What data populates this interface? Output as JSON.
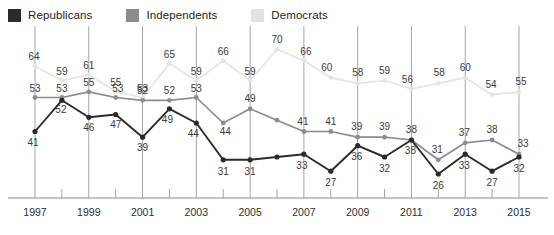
{
  "legend": {
    "position": "top-left",
    "items": [
      {
        "label": "Republicans",
        "color": "#2b2b2b",
        "icon": "legend-swatch"
      },
      {
        "label": "Independents",
        "color": "#8c8c8c",
        "icon": "legend-swatch"
      },
      {
        "label": "Democrats",
        "color": "#e2e2e2",
        "icon": "legend-swatch"
      }
    ]
  },
  "chart_data": {
    "type": "line",
    "title": "",
    "subtitle": "",
    "xlabel": "",
    "ylabel": "",
    "x": [
      1997,
      1998,
      1999,
      2000,
      2001,
      2002,
      2003,
      2004,
      2005,
      2006,
      2007,
      2008,
      2009,
      2010,
      2011,
      2012,
      2013,
      2014,
      2015
    ],
    "tick_labels": [
      "1997",
      "1999",
      "2001",
      "2003",
      "2005",
      "2007",
      "2009",
      "2011",
      "2013",
      "2015"
    ],
    "tick_values": [
      1997,
      1999,
      2001,
      2003,
      2005,
      2007,
      2009,
      2011,
      2013,
      2015
    ],
    "xlim": [
      1997,
      2015
    ],
    "ylim": [
      20,
      74
    ],
    "grid": "vertical-only",
    "series": [
      {
        "name": "Republicans",
        "color": "#2b2b2b",
        "values": [
          41,
          52,
          46,
          47,
          39,
          49,
          44,
          31,
          31,
          32,
          33,
          27,
          36,
          32,
          38,
          26,
          33,
          27,
          32
        ],
        "labels": [
          "41",
          "52",
          "46",
          "47",
          "39",
          "49",
          "44",
          "31",
          "31",
          "",
          "33",
          "27",
          "36",
          "32",
          "38",
          "26",
          "33",
          "27",
          "32"
        ]
      },
      {
        "name": "Independents",
        "color": "#8c8c8c",
        "values": [
          53,
          53,
          55,
          53,
          52,
          52,
          53,
          44,
          49,
          45,
          41,
          41,
          39,
          39,
          38,
          31,
          37,
          38,
          33
        ],
        "labels": [
          "53",
          "53",
          "55",
          "53",
          "52",
          "52",
          "53",
          "44",
          "49",
          "",
          "41",
          "41",
          "39",
          "39",
          "38",
          "31",
          "37",
          "38",
          "33"
        ]
      },
      {
        "name": "Democrats",
        "color": "#e4e4e4",
        "values": [
          64,
          59,
          61,
          55,
          53,
          65,
          59,
          66,
          59,
          70,
          66,
          60,
          58,
          59,
          56,
          58,
          60,
          54,
          55
        ],
        "labels": [
          "64",
          "59",
          "61",
          "55",
          "53",
          "65",
          "59",
          "66",
          "59",
          "70",
          "66",
          "60",
          "58",
          "59",
          "56",
          "58",
          "60",
          "54",
          "55"
        ]
      }
    ]
  },
  "axis": {
    "baseline_color": "#8a8a8a",
    "gridline_color": "#9a9a9a"
  }
}
